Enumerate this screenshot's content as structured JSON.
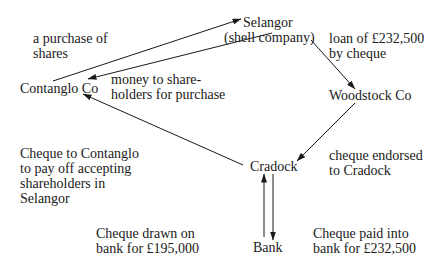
{
  "nodes": {
    "selangor": "Selangor",
    "selangor_sub": "(shell company)",
    "contanglo": "Contanglo Co",
    "woodstock": "Woodstock Co",
    "cradock": "Cradock",
    "bank": "Bank"
  },
  "edge_labels": {
    "purchase_of_shares": [
      "a purchase of",
      "shares"
    ],
    "money_to_shareholders": [
      "money to share-",
      "holders for purchase"
    ],
    "loan": [
      "loan of £232,500",
      "by cheque"
    ],
    "cheque_endorsed": [
      "cheque endorsed",
      "to Cradock"
    ],
    "cheque_to_contanglo": [
      "Cheque to Contanglo",
      "to pay off accepting",
      "shareholders in",
      "Selangor"
    ],
    "cheque_drawn": [
      "Cheque drawn on",
      "bank for £195,000"
    ],
    "cheque_paid": [
      "Cheque paid into",
      "bank for £232,500"
    ]
  },
  "colors": {
    "ink": "#1a1a1a",
    "background": "#ffffff"
  }
}
